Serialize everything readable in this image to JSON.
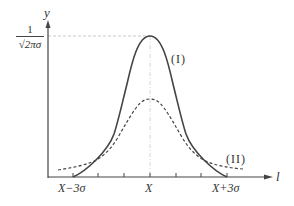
{
  "diagram": {
    "type": "normal-distribution-comparison",
    "axes": {
      "y_label": "y",
      "x_label": "l",
      "y_tick_label": {
        "numerator": "1",
        "denominator": "√2πσ"
      },
      "x_tick_labels": [
        "X−3σ",
        "X",
        "X+3σ"
      ]
    },
    "curves": [
      {
        "name": "(I)",
        "style": "solid",
        "color": "#444444"
      },
      {
        "name": "(II)",
        "style": "dashed",
        "color": "#444444"
      }
    ],
    "colors": {
      "line": "#444444",
      "guide": "#bbbbbb",
      "text": "#333333"
    }
  }
}
